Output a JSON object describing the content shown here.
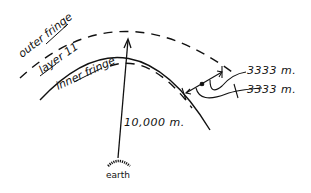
{
  "diagram": {
    "labels": {
      "outer_fringe": "outer fringe",
      "layer": "layer 11",
      "inner_fringe": "inner fringe",
      "earth": "earth"
    },
    "measurements": {
      "radius": "10,000 m.",
      "outer_thickness": "3333 m.",
      "inner_thickness": "3333 m."
    },
    "colors": {
      "ink": "#111111",
      "background": "#ffffff"
    }
  }
}
